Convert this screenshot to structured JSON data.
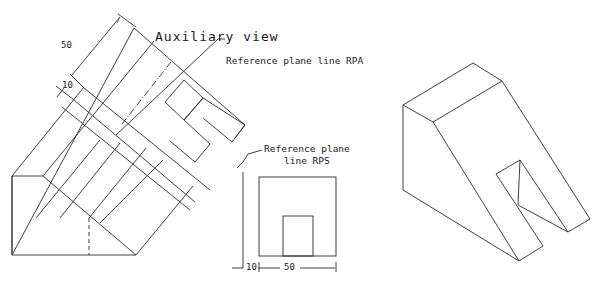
{
  "diagram": {
    "auxiliary_view": {
      "title": "Auxiliary view",
      "dim_50": "50",
      "dim_10": "10"
    },
    "rpa_label": "Reference plane line RPA",
    "rps_label_line1": "Reference plane",
    "rps_label_line2": "line RPS",
    "front_view": {
      "dim_10": "10",
      "dim_50": "50"
    },
    "colors": {
      "line": "#2a2a2a",
      "background": "#ffffff"
    }
  }
}
